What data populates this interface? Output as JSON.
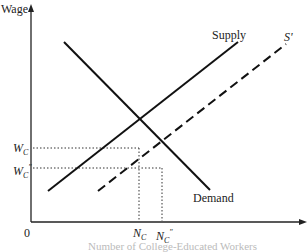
{
  "diagram": {
    "type": "supply-demand",
    "y_axis_label": "Wage",
    "origin_label": "0",
    "x_axis_label_clipped": "Number of College-Educated Workers",
    "curves": [
      {
        "name": "Demand",
        "style": "solid"
      },
      {
        "name": "Supply",
        "style": "solid"
      },
      {
        "name": "S'",
        "style": "dashed"
      }
    ],
    "y_ticks": [
      {
        "base": "W",
        "sub": "C",
        "sup": ""
      },
      {
        "base": "W",
        "sub": "C",
        "sup": "\""
      }
    ],
    "x_ticks": [
      {
        "base": "N",
        "sub": "C",
        "sup": ""
      },
      {
        "base": "N",
        "sub": "C",
        "sup": "\""
      }
    ]
  }
}
